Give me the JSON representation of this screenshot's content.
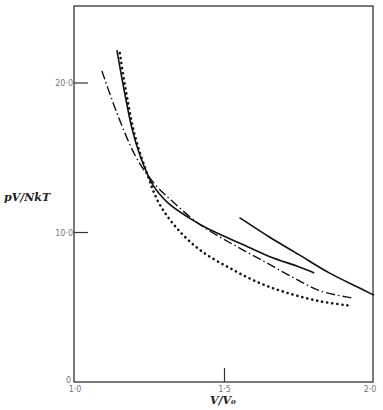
{
  "chart_data": {
    "type": "line",
    "title": "",
    "xlabel": "V/V₀",
    "ylabel": "pV/NkT",
    "xlim": [
      1.0,
      2.0
    ],
    "ylim": [
      0,
      24
    ],
    "grid": false,
    "legend": "none",
    "x_ticks": [
      {
        "value": 1.0,
        "label": "1·0"
      },
      {
        "value": 1.5,
        "label": "1·5"
      },
      {
        "value": 2.0,
        "label": "2·0"
      }
    ],
    "y_ticks": [
      {
        "value": 0,
        "label": "0"
      },
      {
        "value": 10,
        "label": "10·0"
      },
      {
        "value": 20,
        "label": "20·0"
      }
    ],
    "series": [
      {
        "name": "solid-curve-a",
        "style": "solid",
        "x": [
          1.14,
          1.16,
          1.19,
          1.22,
          1.26,
          1.31,
          1.38,
          1.45,
          1.55,
          1.65,
          1.75,
          1.8
        ],
        "y": [
          22.2,
          20.0,
          17.0,
          15.0,
          13.2,
          12.0,
          11.0,
          10.2,
          9.3,
          8.4,
          7.7,
          7.3
        ]
      },
      {
        "name": "solid-curve-b",
        "style": "solid",
        "x": [
          1.55,
          1.65,
          1.75,
          1.85,
          1.95,
          2.0
        ],
        "y": [
          11.0,
          9.7,
          8.5,
          7.3,
          6.3,
          5.8
        ]
      },
      {
        "name": "dash-dot-curve",
        "style": "dashdot",
        "x": [
          1.09,
          1.14,
          1.2,
          1.26,
          1.33,
          1.42,
          1.52,
          1.62,
          1.72,
          1.82,
          1.93
        ],
        "y": [
          20.8,
          18.0,
          15.2,
          13.4,
          12.0,
          10.5,
          9.3,
          8.2,
          7.1,
          6.1,
          5.6
        ]
      },
      {
        "name": "dotted-curve",
        "style": "dotted",
        "x": [
          1.15,
          1.17,
          1.2,
          1.24,
          1.28,
          1.34,
          1.42,
          1.52,
          1.62,
          1.72,
          1.82,
          1.92
        ],
        "y": [
          22.0,
          19.5,
          16.5,
          14.0,
          12.0,
          10.3,
          8.8,
          7.6,
          6.6,
          5.9,
          5.4,
          5.1
        ]
      }
    ]
  }
}
